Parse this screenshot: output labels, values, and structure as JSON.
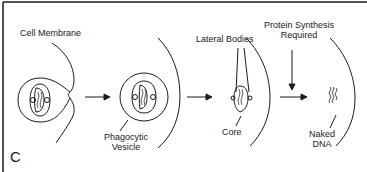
{
  "diagram": {
    "panel_label": "C",
    "labels": {
      "cell_membrane": "Cell Membrane",
      "phagocytic_vesicle_line1": "Phagocytic",
      "phagocytic_vesicle_line2": "Vesicle",
      "lateral_bodies": "Lateral Bodies",
      "core": "Core",
      "protein_synthesis_line1": "Protein Synthesis",
      "protein_synthesis_line2": "Required",
      "naked_dna_line1": "Naked",
      "naked_dna_line2": "DNA"
    },
    "stages": [
      "engulfment",
      "phagocytic vesicle",
      "core release",
      "naked DNA"
    ],
    "colors": {
      "line": "#1a1a1a",
      "background": "#ffffff"
    }
  }
}
